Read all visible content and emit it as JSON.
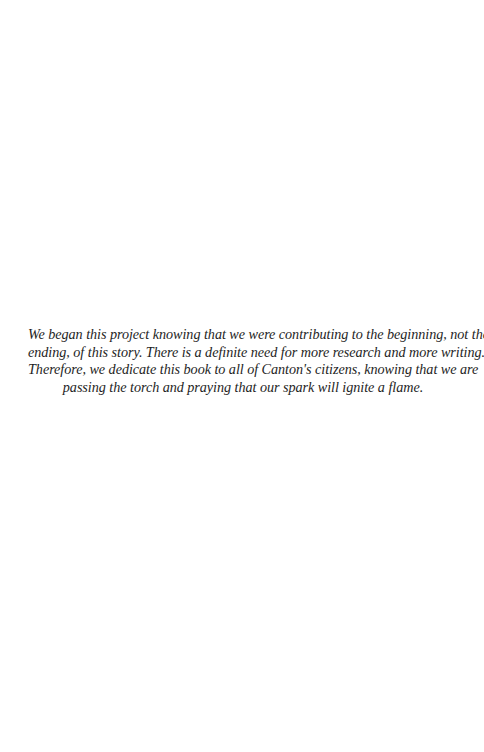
{
  "page": {
    "background": "#ffffff",
    "text_color": "#1e1e1e"
  },
  "dedication": {
    "lines": [
      "We began this project knowing that we were contributing to the beginning, not the",
      "ending, of this story. There is a definite need for more research and more writing.",
      "Therefore, we dedicate this book to all of Canton's citizens, knowing that we are",
      "passing the torch and praying that our spark will ignite a flame."
    ]
  }
}
